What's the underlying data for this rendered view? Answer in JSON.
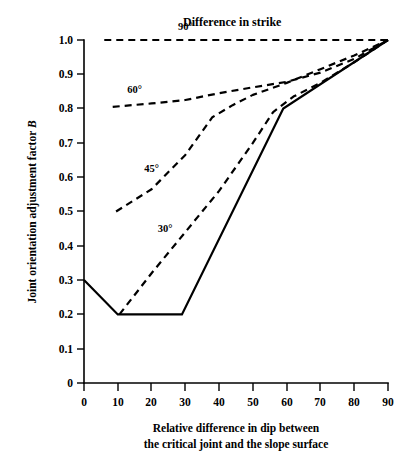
{
  "chart_data": {
    "type": "line",
    "title": "Difference in strike",
    "xlabel": "Relative difference in dip between the critical joint and the slope surface",
    "ylabel": "Joint orientation adjustment factor B",
    "xlim": [
      0,
      90
    ],
    "ylim": [
      0,
      1.0
    ],
    "grid": false,
    "legend_position": "inline-labels",
    "xticks": [
      0,
      10,
      20,
      30,
      40,
      50,
      60,
      70,
      80,
      90
    ],
    "xtick_labels": [
      "0",
      "10",
      "20",
      "30",
      "40",
      "50",
      "60",
      "70",
      "80",
      "90"
    ],
    "yticks": [
      0,
      0.1,
      0.2,
      0.3,
      0.4,
      0.5,
      0.6,
      0.7,
      0.8,
      0.9,
      1.0
    ],
    "ytick_labels": [
      "0",
      "0.1",
      "0.2",
      "0.3",
      "0.4",
      "0.5",
      "0.6",
      "0.7",
      "0.8",
      "0.9",
      "1.0"
    ],
    "series": [
      {
        "name": "90°",
        "label": "90°",
        "style": "dashed",
        "label_x": 30,
        "label_y": 1.03,
        "x": [
          6,
          20,
          40,
          60,
          80,
          90
        ],
        "y": [
          1.0,
          1.0,
          1.0,
          1.0,
          1.0,
          1.0
        ]
      },
      {
        "name": "60°",
        "label": "60°",
        "style": "dashed",
        "label_x": 15,
        "label_y": 0.845,
        "x": [
          8.5,
          20,
          30,
          40,
          50,
          60,
          70,
          80,
          90
        ],
        "y": [
          0.805,
          0.815,
          0.825,
          0.845,
          0.862,
          0.878,
          0.905,
          0.945,
          1.0
        ]
      },
      {
        "name": "45°",
        "label": "45°",
        "style": "dashed",
        "label_x": 20,
        "label_y": 0.615,
        "x": [
          9.5,
          20,
          30,
          38,
          44,
          50,
          60,
          70,
          80,
          90
        ],
        "y": [
          0.5,
          0.565,
          0.665,
          0.775,
          0.81,
          0.84,
          0.875,
          0.915,
          0.955,
          1.0
        ]
      },
      {
        "name": "30°",
        "label": "30°",
        "style": "dashed",
        "label_x": 24,
        "label_y": 0.44,
        "x": [
          10.5,
          20,
          30,
          40,
          50,
          56,
          62,
          70,
          80,
          90
        ],
        "y": [
          0.2,
          0.32,
          0.44,
          0.56,
          0.7,
          0.79,
          0.835,
          0.875,
          0.935,
          1.0
        ]
      },
      {
        "name": "solid",
        "label": "",
        "style": "solid",
        "x": [
          0,
          10,
          29,
          59,
          90
        ],
        "y": [
          0.3,
          0.2,
          0.2,
          0.8,
          1.0
        ]
      }
    ]
  },
  "axis_caption": {
    "line1": "Relative difference in dip between",
    "line2": "the critical joint and the slope surface"
  },
  "y_axis_title": {
    "prefix": "Joint orientation adjustment factor ",
    "symbol": "B"
  },
  "legend": {
    "title": "Difference in strike"
  }
}
